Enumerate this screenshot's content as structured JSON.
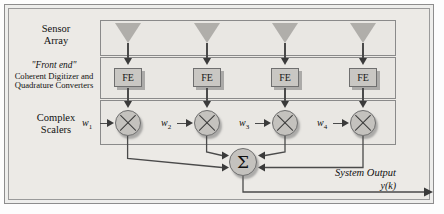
{
  "diagram": {
    "bands": [
      {
        "id": "sensor",
        "label_line1": "Sensor",
        "label_line2": "Array"
      },
      {
        "id": "frontend",
        "label_title": "\"Front end\"",
        "label_line1": "Coherent Digitizer and",
        "label_line2": "Quadrature Converters"
      },
      {
        "id": "scaler",
        "label_line1": "Complex",
        "label_line2": "Scalers"
      }
    ],
    "channels": [
      {
        "index": 1,
        "fe_label": "FE",
        "weight": "w",
        "weight_sub": "1"
      },
      {
        "index": 2,
        "fe_label": "FE",
        "weight": "w",
        "weight_sub": "2"
      },
      {
        "index": 3,
        "fe_label": "FE",
        "weight": "w",
        "weight_sub": "3"
      },
      {
        "index": 4,
        "fe_label": "FE",
        "weight": "w",
        "weight_sub": "4"
      }
    ],
    "summation": {
      "symbol": "Σ",
      "name": "summing-junction"
    },
    "output": {
      "line1": "System Output",
      "line2": "y(k)"
    },
    "colors": {
      "page_background": "#fdfdfd",
      "frame_fill": "#eeeeec",
      "band_fill": "#e9e7e3",
      "band_border": "#8a8a8a",
      "element_fill": "#c4c2be",
      "element_border": "#6f6f6f",
      "triangle_fill": "#b0aeaa",
      "line": "#4a4a4a",
      "text": "#111111"
    }
  }
}
